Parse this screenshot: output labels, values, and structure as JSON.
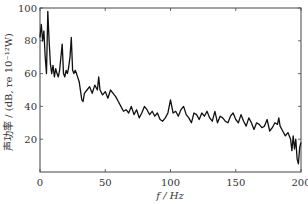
{
  "chart_data": {
    "type": "line",
    "title": "",
    "xlabel": "f / Hz",
    "ylabel": "声功率 / (dB, re 10⁻¹²W)",
    "xlim": [
      0,
      200
    ],
    "ylim": [
      0,
      100
    ],
    "xticks": [
      0,
      50,
      100,
      150,
      200
    ],
    "yticks": [
      20,
      40,
      60,
      80,
      100
    ],
    "ytick_labels_left": [
      "20",
      "40",
      "60",
      "80",
      "100"
    ],
    "y_origin_label": "0",
    "grid": false,
    "legend": null,
    "series": [
      {
        "name": "声功率",
        "color": "#111111",
        "x": [
          0,
          1,
          2,
          3,
          4,
          5,
          6,
          7,
          8,
          9,
          10,
          11,
          12,
          13,
          14,
          15,
          16,
          17,
          18,
          19,
          20,
          21,
          22,
          23,
          24,
          25,
          26,
          27,
          28,
          30,
          32,
          33,
          34,
          36,
          38,
          40,
          42,
          44,
          45,
          46,
          48,
          50,
          52,
          54,
          56,
          58,
          60,
          62,
          64,
          66,
          68,
          70,
          72,
          74,
          76,
          78,
          80,
          82,
          84,
          86,
          88,
          90,
          92,
          94,
          96,
          98,
          100,
          102,
          104,
          106,
          108,
          110,
          112,
          114,
          116,
          118,
          120,
          122,
          124,
          126,
          128,
          130,
          132,
          134,
          136,
          138,
          140,
          142,
          144,
          146,
          148,
          150,
          152,
          154,
          156,
          158,
          160,
          162,
          164,
          166,
          168,
          170,
          172,
          174,
          176,
          178,
          180,
          182,
          183,
          184,
          186,
          188,
          190,
          192,
          193,
          194,
          195,
          196,
          197,
          198,
          199,
          200
        ],
        "values": [
          82,
          90,
          80,
          86,
          70,
          60,
          98,
          80,
          66,
          60,
          65,
          58,
          63,
          60,
          58,
          62,
          70,
          78,
          60,
          58,
          62,
          60,
          64,
          70,
          82,
          62,
          60,
          62,
          60,
          55,
          44,
          43,
          48,
          50,
          52,
          48,
          53,
          50,
          58,
          50,
          47,
          49,
          45,
          50,
          48,
          46,
          43,
          40,
          37,
          38,
          36,
          40,
          35,
          38,
          33,
          36,
          40,
          38,
          35,
          37,
          34,
          36,
          32,
          31,
          33,
          36,
          44,
          36,
          37,
          34,
          38,
          40,
          35,
          33,
          30,
          36,
          35,
          32,
          36,
          34,
          37,
          33,
          31,
          37,
          30,
          34,
          33,
          31,
          30,
          34,
          36,
          32,
          30,
          35,
          31,
          28,
          33,
          30,
          26,
          30,
          29,
          27,
          28,
          32,
          25,
          27,
          30,
          29,
          33,
          28,
          25,
          22,
          24,
          20,
          13,
          22,
          14,
          20,
          8,
          5,
          15,
          18
        ]
      }
    ]
  }
}
